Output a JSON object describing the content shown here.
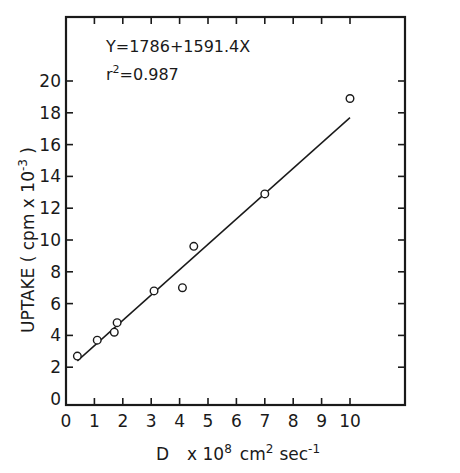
{
  "chart_data": {
    "type": "scatter",
    "title": "",
    "xlabel": "D x 10^8 cm^2 sec^-1",
    "ylabel": "UPTAKE (cpm x 10^-3)",
    "xlim": [
      0,
      12
    ],
    "ylim": [
      0,
      22
    ],
    "x_ticks": [
      0,
      1,
      2,
      3,
      4,
      5,
      6,
      7,
      8,
      9,
      10
    ],
    "y_ticks": [
      0,
      2,
      4,
      6,
      8,
      10,
      12,
      14,
      16,
      18,
      20
    ],
    "grid": false,
    "legend": null,
    "series": [
      {
        "name": "data",
        "marker": "open-circle",
        "points": [
          {
            "x": 0.4,
            "y": 2.7
          },
          {
            "x": 1.1,
            "y": 3.7
          },
          {
            "x": 1.7,
            "y": 4.2
          },
          {
            "x": 1.8,
            "y": 4.8
          },
          {
            "x": 3.1,
            "y": 6.8
          },
          {
            "x": 4.1,
            "y": 7.0
          },
          {
            "x": 4.5,
            "y": 9.6
          },
          {
            "x": 7.0,
            "y": 12.9
          },
          {
            "x": 10.0,
            "y": 18.9
          }
        ]
      },
      {
        "name": "fit",
        "type": "line",
        "points": [
          {
            "x": 0.4,
            "y": 2.4
          },
          {
            "x": 10.0,
            "y": 17.7
          }
        ]
      }
    ],
    "annotations": [
      "Y=1786+1591.4X",
      "r2=0.987"
    ]
  },
  "labels": {
    "equation": "Y=1786+1591.4X",
    "r2_prefix": "r",
    "r2_sup": "2",
    "r2_value": "=0.987",
    "ylabel_main": "UPTAKE ( cpm x 10",
    "ylabel_sup": "-3",
    "ylabel_close": " )",
    "xlabel_D": "D",
    "xlabel_x10": "x 10",
    "xlabel_sup8": "8",
    "xlabel_cm": "cm",
    "xlabel_sup2": "2",
    "xlabel_sec": "sec",
    "xlabel_supm1": "-1"
  },
  "style": {
    "ink": "#1a1a1a",
    "background": "#ffffff"
  }
}
